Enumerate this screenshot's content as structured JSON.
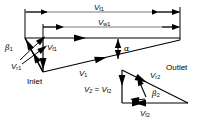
{
  "figure": {
    "type": "vector-velocity-triangle-diagram",
    "background_color": "#ffffff",
    "line_color": "#000000",
    "dimension_line_color": "#6b6b6b"
  },
  "labels": {
    "v_f1_top": {
      "symbol": "V",
      "sub": "f1",
      "x": 94,
      "y": 8
    },
    "v_w1_top": {
      "symbol": "V",
      "sub": "w1",
      "x": 100,
      "y": 23
    },
    "beta_1": {
      "symbol": "β",
      "sub": "1",
      "x": 7,
      "y": 43
    },
    "v_f1_inlet": {
      "symbol": "V",
      "sub": "f1",
      "x": 44,
      "y": 45
    },
    "v_r1": {
      "symbol": "V",
      "sub": "r1",
      "x": 13,
      "y": 62
    },
    "alpha": {
      "symbol": "α",
      "sub": "",
      "x": 124,
      "y": 45
    },
    "v_1": {
      "symbol": "V",
      "sub": "1",
      "x": 79,
      "y": 70
    },
    "inlet": {
      "symbol": "Inlet",
      "sub": "",
      "x": 27,
      "y": 78
    },
    "v_2_eq_v_f2": {
      "symbol": "V₂ = V",
      "sub": "f2",
      "x": 87,
      "y": 86
    },
    "v_r2": {
      "symbol": "V",
      "sub": "r2",
      "x": 152,
      "y": 73
    },
    "beta_2": {
      "symbol": "β",
      "sub": "2",
      "x": 152,
      "y": 91
    },
    "v_f2": {
      "symbol": "V",
      "sub": "f2",
      "x": 141,
      "y": 111
    },
    "outlet": {
      "symbol": "Outlet",
      "sub": "",
      "x": 168,
      "y": 66
    }
  },
  "geometry": {
    "dimension_v_f1": {
      "x1": 25,
      "x2": 180,
      "y": 12,
      "arrows": "both"
    },
    "dimension_v_w1": {
      "x1": 43,
      "x2": 180,
      "y": 27,
      "arrows": "both"
    },
    "extension_left_outer": {
      "x": 25,
      "y1": 12,
      "y2": 38
    },
    "extension_left_inner": {
      "x": 43,
      "y1": 27,
      "y2": 38
    },
    "extension_right": {
      "x": 180,
      "y1": 8,
      "y2": 40
    },
    "inlet_triangle": {
      "top_left": [
        25,
        38
      ],
      "top_right": [
        180,
        38
      ],
      "apex": [
        43,
        72
      ],
      "hypotenuse_to": [
        180,
        40
      ]
    },
    "outlet_triangle": {
      "top": [
        122,
        70
      ],
      "bottom_left": [
        122,
        103
      ],
      "right": [
        188,
        103
      ]
    }
  },
  "vectors": [
    {
      "name": "V_f1 top dimension",
      "direction": "horizontal-double"
    },
    {
      "name": "V_w1 top dimension",
      "direction": "horizontal-double"
    },
    {
      "name": "V_w1 flow vector",
      "direction": "leftward"
    },
    {
      "name": "V_f1 inlet vertical",
      "direction": "downward"
    },
    {
      "name": "V_r1 relative",
      "direction": "down-left"
    },
    {
      "name": "V_1 absolute",
      "direction": "up-right"
    },
    {
      "name": "alpha angle arc",
      "direction": "vertical-double"
    },
    {
      "name": "V_f2 outlet vertical",
      "direction": "downward"
    },
    {
      "name": "V_f2 outlet horizontal",
      "direction": "rightward"
    },
    {
      "name": "V_r2 relative outlet",
      "direction": "up-left"
    },
    {
      "name": "beta_2 angle arc",
      "direction": "arc"
    }
  ]
}
